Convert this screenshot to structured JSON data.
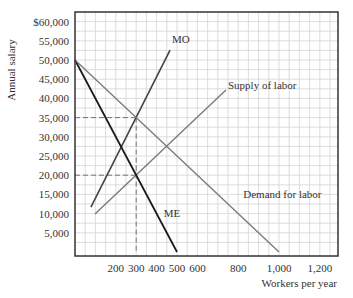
{
  "chart_data": {
    "type": "line",
    "title": "",
    "xlabel": "Workers per year",
    "ylabel": "Annual salary",
    "xlim": [
      0,
      1290
    ],
    "ylim": [
      0,
      62600
    ],
    "grid": true,
    "x_ticks": [
      {
        "value": 200,
        "label": "200"
      },
      {
        "value": 300,
        "label": "300"
      },
      {
        "value": 400,
        "label": "400"
      },
      {
        "value": 500,
        "label": "500"
      },
      {
        "value": 600,
        "label": "600"
      },
      {
        "value": 800,
        "label": "800"
      },
      {
        "value": 1000,
        "label": "1,000"
      },
      {
        "value": 1200,
        "label": "1,200"
      }
    ],
    "y_ticks": [
      {
        "value": 5000,
        "label": "5,000"
      },
      {
        "value": 10000,
        "label": "10,000"
      },
      {
        "value": 15000,
        "label": "15,000"
      },
      {
        "value": 20000,
        "label": "20,000"
      },
      {
        "value": 25000,
        "label": "25,000"
      },
      {
        "value": 30000,
        "label": "30,000"
      },
      {
        "value": 35000,
        "label": "35,000"
      },
      {
        "value": 40000,
        "label": "40,000"
      },
      {
        "value": 45000,
        "label": "45,000"
      },
      {
        "value": 50000,
        "label": "50,000"
      },
      {
        "value": 55000,
        "label": "55,000"
      },
      {
        "value": 60000,
        "label": "$60,000"
      }
    ],
    "series": [
      {
        "name": "MO",
        "color": "#444444",
        "width": 1.6,
        "points": [
          [
            78,
            11700
          ],
          [
            466,
            52600
          ]
        ],
        "label_at": [
          475,
          54500
        ]
      },
      {
        "name": "Supply of labor",
        "color": "#7a7a7a",
        "width": 1.4,
        "points": [
          [
            98,
            9900
          ],
          [
            740,
            42200
          ]
        ],
        "label_at": [
          750,
          42500
        ]
      },
      {
        "name": "ME",
        "color": "#1a1a1a",
        "width": 1.8,
        "points": [
          [
            0,
            50000
          ],
          [
            500,
            0
          ]
        ],
        "label_at": [
          435,
          9000
        ]
      },
      {
        "name": "Demand for labor",
        "color": "#7a7a7a",
        "width": 1.4,
        "points": [
          [
            0,
            50000
          ],
          [
            1000,
            0
          ]
        ],
        "label_at": [
          825,
          14000
        ]
      }
    ],
    "reference_lines": [
      {
        "type": "dashed",
        "points": [
          [
            0,
            35000
          ],
          [
            300,
            35000
          ]
        ]
      },
      {
        "type": "dashed",
        "points": [
          [
            0,
            20000
          ],
          [
            300,
            20000
          ]
        ]
      },
      {
        "type": "dashed",
        "points": [
          [
            300,
            35000
          ],
          [
            300,
            0
          ]
        ]
      }
    ]
  }
}
